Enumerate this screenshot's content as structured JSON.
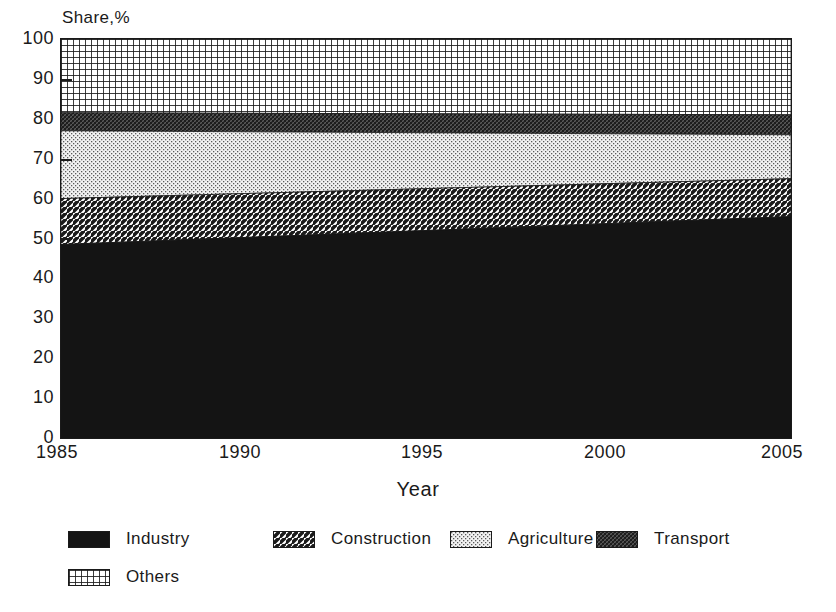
{
  "chart_data": {
    "type": "area",
    "title": "",
    "subtitle": "",
    "xlabel": "Year",
    "ylabel": "Share,%",
    "stacked": true,
    "grid": false,
    "legend_position": "bottom",
    "xlim": [
      1985,
      2005
    ],
    "ylim": [
      0,
      100
    ],
    "xticks": [
      1985,
      1990,
      1995,
      2000,
      2005
    ],
    "yticks": [
      0,
      10,
      20,
      30,
      40,
      50,
      60,
      70,
      80,
      90,
      100
    ],
    "x": [
      1985,
      2005
    ],
    "series": [
      {
        "name": "Industry",
        "values": [
          48.5,
          55.5
        ],
        "pattern": "solid-black",
        "color": "#141414"
      },
      {
        "name": "Construction",
        "values": [
          11.5,
          9.5
        ],
        "pattern": "diagonal-hatch",
        "color": "#b4b4b4"
      },
      {
        "name": "Agriculture",
        "values": [
          17.0,
          11.0
        ],
        "pattern": "light-dots",
        "color": "#d9d9d9"
      },
      {
        "name": "Transport",
        "values": [
          4.5,
          5.0
        ],
        "pattern": "dense-crosshatch",
        "color": "#2b2b2b"
      },
      {
        "name": "Others",
        "values": [
          18.5,
          19.0
        ],
        "pattern": "grid-mesh",
        "color": "#9a9a9a"
      }
    ],
    "cumulative_upper_bounds": {
      "Industry": [
        48.5,
        55.5
      ],
      "Construction": [
        60.0,
        65.0
      ],
      "Agriculture": [
        77.0,
        76.0
      ],
      "Transport": [
        81.5,
        81.0
      ],
      "Others": [
        100.0,
        100.0
      ]
    },
    "annotations": []
  },
  "axes": {
    "y_title": "Share,%",
    "x_title": "Year",
    "y_tick_labels": [
      "100",
      "90",
      "80",
      "70",
      "60",
      "50",
      "40",
      "30",
      "20",
      "10",
      "0"
    ],
    "x_tick_labels": [
      "1985",
      "1990",
      "1995",
      "2000",
      "2005"
    ]
  },
  "legend": {
    "items": [
      {
        "label": "Industry",
        "pattern": "solid-black"
      },
      {
        "label": "Construction",
        "pattern": "diagonal-hatch"
      },
      {
        "label": "Agriculture",
        "pattern": "light-dots"
      },
      {
        "label": "Transport",
        "pattern": "dense-crosshatch"
      },
      {
        "label": "Others",
        "pattern": "grid-mesh"
      }
    ]
  },
  "colors": {
    "ink": "#1a1a1a",
    "background": "#ffffff",
    "industry": "#141414",
    "construction": "#b4b4b4",
    "agriculture": "#d9d9d9",
    "transport": "#2b2b2b",
    "others": "#9a9a9a"
  }
}
